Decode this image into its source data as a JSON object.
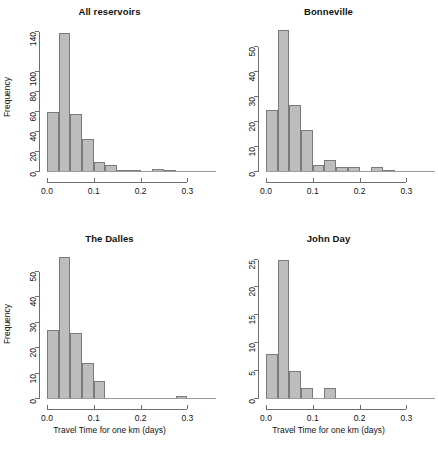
{
  "figure": {
    "background": "#ffffff",
    "bar_fill": "#bdbdbd",
    "bar_stroke": "#7a7a7a",
    "axis_color": "#6e6e6e",
    "xlabel": "Travel Time for one km (days)",
    "ylabel": "Frequency"
  },
  "chart_data": [
    {
      "type": "bar",
      "panel": "top-left",
      "title": "All reservoirs",
      "xlabel": "",
      "ylabel": "Frequency",
      "bin_width": 0.025,
      "bin_starts": [
        0.0,
        0.025,
        0.05,
        0.075,
        0.1,
        0.125,
        0.15,
        0.175,
        0.2,
        0.225,
        0.25
      ],
      "categories": [
        "0.000-0.025",
        "0.025-0.050",
        "0.050-0.075",
        "0.075-0.100",
        "0.100-0.125",
        "0.125-0.150",
        "0.150-0.175",
        "0.175-0.200",
        "0.200-0.225",
        "0.225-0.250",
        "0.250-0.275"
      ],
      "values": [
        60,
        139,
        58,
        33,
        10,
        7,
        2,
        2,
        0,
        3,
        1
      ],
      "xticks": [
        0.0,
        0.1,
        0.2,
        0.3
      ],
      "xticklabels": [
        "0.0",
        "0.1",
        "0.2",
        "0.3"
      ],
      "yticks": [
        0,
        20,
        40,
        60,
        80,
        100,
        140
      ],
      "yticklabels": [
        "0",
        "20",
        "40",
        "60",
        "80",
        "100",
        "140"
      ],
      "xlim": [
        0.0,
        0.31
      ],
      "ylim": [
        0,
        145
      ],
      "grid": false,
      "legend": "none"
    },
    {
      "type": "bar",
      "panel": "top-right",
      "title": "Bonneville",
      "xlabel": "",
      "ylabel": "",
      "bin_width": 0.025,
      "bin_starts": [
        0.0,
        0.025,
        0.05,
        0.075,
        0.1,
        0.125,
        0.15,
        0.175,
        0.2,
        0.225,
        0.25
      ],
      "categories": [
        "0.000-0.025",
        "0.025-0.050",
        "0.050-0.075",
        "0.075-0.100",
        "0.100-0.125",
        "0.125-0.150",
        "0.150-0.175",
        "0.175-0.200",
        "0.200-0.225",
        "0.225-0.250",
        "0.250-0.275"
      ],
      "values": [
        25,
        57,
        27,
        17,
        3,
        5,
        2,
        2,
        0,
        2,
        1
      ],
      "xticks": [
        0.0,
        0.1,
        0.2,
        0.3
      ],
      "xticklabels": [
        "0.0",
        "0.1",
        "0.2",
        "0.3"
      ],
      "yticks": [
        0,
        10,
        20,
        30,
        40,
        50
      ],
      "yticklabels": [
        "0",
        "10",
        "20",
        "30",
        "40",
        "50"
      ],
      "xlim": [
        0.0,
        0.31
      ],
      "ylim": [
        0,
        58
      ],
      "grid": false,
      "legend": "none"
    },
    {
      "type": "bar",
      "panel": "bottom-left",
      "title": "The Dalles",
      "xlabel": "Travel Time for one km (days)",
      "ylabel": "Frequency",
      "bin_width": 0.025,
      "bin_starts": [
        0.0,
        0.025,
        0.05,
        0.075,
        0.1,
        0.125,
        0.15,
        0.175,
        0.2,
        0.225,
        0.25,
        0.275
      ],
      "categories": [
        "0.000-0.025",
        "0.025-0.050",
        "0.050-0.075",
        "0.075-0.100",
        "0.100-0.125",
        "0.125-0.150",
        "0.150-0.175",
        "0.175-0.200",
        "0.200-0.225",
        "0.225-0.250",
        "0.250-0.275",
        "0.275-0.300"
      ],
      "values": [
        27,
        56,
        26,
        14,
        7,
        0,
        0,
        0,
        0,
        0,
        0,
        1
      ],
      "xticks": [
        0.0,
        0.1,
        0.2,
        0.3
      ],
      "xticklabels": [
        "0.0",
        "0.1",
        "0.2",
        "0.3"
      ],
      "yticks": [
        0,
        10,
        20,
        30,
        40,
        50
      ],
      "yticklabels": [
        "0",
        "10",
        "20",
        "30",
        "40",
        "50"
      ],
      "xlim": [
        0.0,
        0.31
      ],
      "ylim": [
        0,
        57
      ],
      "grid": false,
      "legend": "none"
    },
    {
      "type": "bar",
      "panel": "bottom-right",
      "title": "John Day",
      "xlabel": "Travel Time for one km (days)",
      "ylabel": "",
      "bin_width": 0.025,
      "bin_starts": [
        0.0,
        0.025,
        0.05,
        0.075,
        0.1,
        0.125
      ],
      "categories": [
        "0.000-0.025",
        "0.025-0.050",
        "0.050-0.075",
        "0.075-0.100",
        "0.100-0.125",
        "0.125-0.150"
      ],
      "values": [
        8,
        25,
        5,
        2,
        0,
        2
      ],
      "xticks": [
        0.0,
        0.1,
        0.2,
        0.3
      ],
      "xticklabels": [
        "0.0",
        "0.1",
        "0.2",
        "0.3"
      ],
      "yticks": [
        0,
        5,
        10,
        15,
        20,
        25
      ],
      "yticklabels": [
        "0",
        "5",
        "10",
        "15",
        "20",
        "25"
      ],
      "xlim": [
        0.0,
        0.31
      ],
      "ylim": [
        0,
        26
      ],
      "grid": false,
      "legend": "none"
    }
  ]
}
